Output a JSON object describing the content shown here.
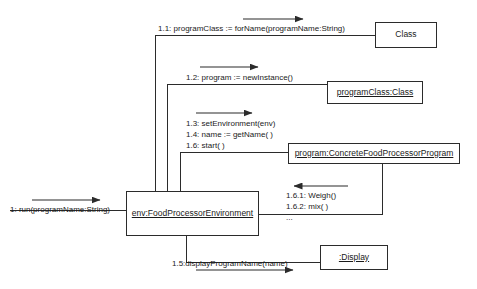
{
  "diagram": {
    "type": "uml-communication-diagram",
    "title": "",
    "background_color": "#ffffff",
    "line_color": "#2b2b2b",
    "text_color": "#1a1a1a",
    "objects": [
      {
        "id": "class",
        "label": "Class",
        "kind": "class",
        "underlined": false,
        "x": 375,
        "y": 22,
        "w": 62,
        "h": 26
      },
      {
        "id": "program-class",
        "label": "programClass:Class",
        "kind": "instance",
        "underlined": true,
        "x": 327,
        "y": 81,
        "w": 96,
        "h": 23
      },
      {
        "id": "program",
        "label": "program:ConcreteFoodProcessorProgram",
        "kind": "instance",
        "underlined": true,
        "x": 288,
        "y": 143,
        "w": 172,
        "h": 21
      },
      {
        "id": "env",
        "label": "env:FoodProcessorEnvironment",
        "kind": "instance",
        "underlined": true,
        "x": 126,
        "y": 191,
        "w": 133,
        "h": 45
      },
      {
        "id": "display",
        "label": ":Display",
        "kind": "instance",
        "underlined": true,
        "x": 320,
        "y": 245,
        "w": 68,
        "h": 25
      }
    ],
    "messages": [
      {
        "id": "m1",
        "lines": [
          "1: run(programName:String)"
        ],
        "direction": "right",
        "from": "actor",
        "to": "env",
        "x": 10,
        "y": 204
      },
      {
        "id": "m1-1",
        "lines": [
          "1.1: programClass := forName(programName:String)"
        ],
        "direction": "right",
        "from": "env",
        "to": "class",
        "x": 158,
        "y": 23
      },
      {
        "id": "m1-2",
        "lines": [
          "1.2: program := newInstance()"
        ],
        "direction": "right",
        "from": "env",
        "to": "program-class",
        "x": 186,
        "y": 72
      },
      {
        "id": "m1-3-group",
        "lines": [
          "1.3: setEnvironment(env)",
          "1.4: name := getName( )",
          "1.6: start( )"
        ],
        "direction": "right",
        "from": "env",
        "to": "program",
        "x": 186,
        "y": 118
      },
      {
        "id": "m1-6-1-group",
        "lines": [
          "1.6.1: Weigh()",
          "1.6.2: mix( )",
          "..."
        ],
        "direction": "left",
        "from": "program",
        "to": "env",
        "x": 286,
        "y": 190
      },
      {
        "id": "m1-5",
        "lines": [
          "1.5:displayProgramName(name)"
        ],
        "direction": "right",
        "from": "env",
        "to": "display",
        "x": 172,
        "y": 258
      }
    ]
  }
}
